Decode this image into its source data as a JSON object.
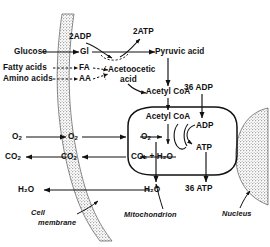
{
  "diagram": {
    "colors": {
      "ink": "#111111",
      "membrane_fill": "#9a9a9a",
      "background": "#ffffff"
    },
    "substrates": {
      "glucose": "Glucose",
      "fatty_acids": "Fatty acids",
      "amino_acids": "Amino acids"
    },
    "intermediates": {
      "gl": "Gl",
      "fa": "FA",
      "aa": "AA"
    },
    "glycolysis": {
      "adp_in": "2ADP",
      "atp_out": "2ATP",
      "product": "Pyruvic  acid"
    },
    "ketone": {
      "line1": "Acetoocetic",
      "line2": "acid"
    },
    "acetyl_coa_cytosol": "Acetyl  CoA",
    "acetyl_coa_matrix": "Acetyl  CoA",
    "oxidative": {
      "adp_in_total": "36 ADP",
      "adp": "ADP",
      "atp": "ATP",
      "atp_out_total": "36 ATP"
    },
    "gases": {
      "o2_outside": "O",
      "o2_outside_sub": "2",
      "o2_cytosol": "O",
      "o2_cytosol_sub": "2",
      "o2_matrix": "O",
      "o2_matrix_sub": "2",
      "co2_outside": "CO",
      "co2_outside_sub": "2",
      "co2_cytosol": "CO",
      "co2_cytosol_sub": "2",
      "co2_h2o_matrix": "CO₂ + H₂O",
      "h2o_outside": "H₂O",
      "h2o_cytosol": "H₂O"
    },
    "structures": {
      "cell_membrane_line1": "Cell",
      "cell_membrane_line2": "membrane",
      "mitochondrion": "Mitochondrion",
      "nucleus": "Nucleus"
    }
  }
}
